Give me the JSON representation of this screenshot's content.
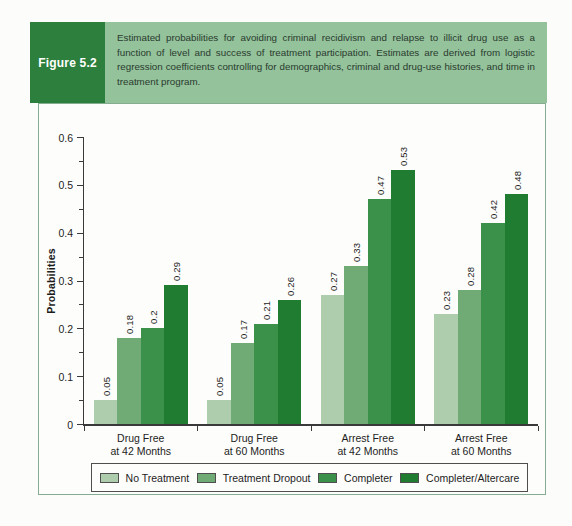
{
  "figure": {
    "label": "Figure 5.2",
    "caption": "Estimated probabilities for avoiding criminal recidivism and relapse to illicit drug use as a function of level and success of treatment participation. Estimates are derived from logistic regression coefficients controlling for demographics, criminal and drug-use histories, and time in treatment program."
  },
  "colors": {
    "figure_label_bg": "#2c7f3c",
    "caption_bg": "#93c29b",
    "chart_border": "#84ad90",
    "axis": "#3a3a3a",
    "series": [
      "#aecdad",
      "#70ab76",
      "#3b9149",
      "#1f7c31"
    ]
  },
  "chart_data": {
    "type": "bar",
    "title": "",
    "xlabel": "",
    "ylabel": "Probabilities",
    "ylim": [
      0,
      0.6
    ],
    "yticks": [
      "0",
      "0.1",
      "0.2",
      "0.3",
      "0.4",
      "0.5",
      "0.6"
    ],
    "minor_tick_step": 0.05,
    "grid": false,
    "legend_position": "bottom",
    "categories": [
      {
        "line1": "Drug Free",
        "line2": "at 42 Months"
      },
      {
        "line1": "Drug Free",
        "line2": "at 60 Months"
      },
      {
        "line1": "Arrest Free",
        "line2": "at 42 Months"
      },
      {
        "line1": "Arrest Free",
        "line2": "at 60 Months"
      }
    ],
    "series": [
      {
        "name": "No Treatment",
        "color": "#aecdad",
        "values": [
          0.05,
          0.05,
          0.27,
          0.23
        ],
        "labels": [
          "0.05",
          "0.05",
          "0.27",
          "0.23"
        ]
      },
      {
        "name": "Treatment Dropout",
        "color": "#70ab76",
        "values": [
          0.18,
          0.17,
          0.33,
          0.28
        ],
        "labels": [
          "0.18",
          "0.17",
          "0.33",
          "0.28"
        ]
      },
      {
        "name": "Completer",
        "color": "#3b9149",
        "values": [
          0.2,
          0.21,
          0.47,
          0.42
        ],
        "labels": [
          "0.2",
          "0.21",
          "0.47",
          "0.42"
        ]
      },
      {
        "name": "Completer/Altercare",
        "color": "#1f7c31",
        "values": [
          0.29,
          0.26,
          0.53,
          0.48
        ],
        "labels": [
          "0.29",
          "0.26",
          "0.53",
          "0.48"
        ]
      }
    ]
  }
}
